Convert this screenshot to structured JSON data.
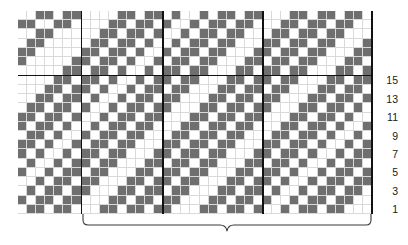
{
  "chart_data": {
    "type": "heatmap",
    "title": "",
    "subtitle": "",
    "xlabel": "",
    "ylabel": "",
    "grid": {
      "columns": 39,
      "rows": 22,
      "cell_px": 9,
      "fill_color": "#706f70",
      "empty_color": "#ffffff",
      "gridline_color": "#d9d9d9",
      "rule_color": "#111111"
    },
    "legend": [
      {
        "label": "filled stitch",
        "color": "#706f70"
      },
      {
        "label": "background stitch",
        "color": "#ffffff"
      }
    ],
    "section_rules": {
      "vertical_columns": [
        7,
        16,
        27
      ],
      "horizontal_rows": [
        7
      ]
    },
    "rows_top_to_bottom": [
      "001101100001101101001011011000110110110",
      "110011000011011010010110110001101101100",
      "001100000110110100101101100011011011000",
      "011000001101101001011011000110110110001",
      "110000011011010010110110001101101100011",
      "100000110110100101101100011011011000110",
      "000001101101001011011000110110110001101",
      "000011011010010110110001101101100011011",
      "000110110100101101100011011011000110110",
      "001101101001011011000110110110001101101",
      "011011010010110110001101101100011011010",
      "110110100101101100011011011000110110100",
      "101101001011011000110110110001101101001",
      "011010010110110001101101100011011010010",
      "110100101101100011011011000110110100101",
      "101001011011000110110110001101101001011",
      "010010110110001101101100011011010010110",
      "100101101100011011011000110110100101101",
      "001011011000110110110001101101001011011",
      "010110110001101101100011011010010110110",
      "101101100011011011000110110100101101100",
      "011011000110110110001101101001011011000"
    ],
    "row_number_labels": [
      "15",
      "13",
      "11",
      "9",
      "7",
      "5",
      "3",
      "1"
    ],
    "row_number_values": [
      15,
      13,
      11,
      9,
      7,
      5,
      3,
      1
    ],
    "brace": {
      "label": "",
      "spans_columns": "repeat section"
    }
  },
  "axis": {
    "right_numbers": [
      "15",
      "13",
      "11",
      "9",
      "7",
      "5",
      "3",
      "1"
    ]
  }
}
